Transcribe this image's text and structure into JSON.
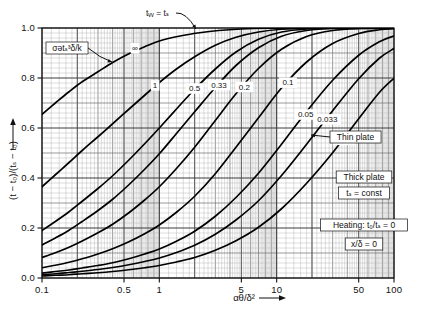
{
  "figure": {
    "panel_label": "(a)",
    "background": "#ffffff",
    "ink": "#111111",
    "grid_major": "#4a4a4a",
    "grid_minor": "#9a9a9a",
    "curve_color": "#000000"
  },
  "chart_data": {
    "type": "line",
    "title": "",
    "subtitle": "",
    "xlabel": "αθ/δ²",
    "ylabel": "(t − t₀)/(tₛ − t₀)",
    "xscale": "log",
    "yscale": "linear",
    "xlim": [
      0.1,
      100
    ],
    "ylim": [
      0.0,
      1.0
    ],
    "grid": "log-minor both axes, dense",
    "legend": "inline curve labels",
    "xticks": [
      "0.1",
      "0.5",
      "1",
      "5",
      "10",
      "50",
      "100"
    ],
    "xtick_values": [
      0.1,
      0.5,
      1,
      5,
      10,
      50,
      100
    ],
    "yticks": [
      "0.0",
      "0.2",
      "0.4",
      "0.6",
      "0.8",
      "1.0"
    ],
    "ytick_values": [
      0.0,
      0.2,
      0.4,
      0.6,
      0.8,
      1.0
    ],
    "series_parameter": "σətₛ³δ/k",
    "series": [
      {
        "name": "∞",
        "label": "∞",
        "points": [
          [
            0.1,
            0.655
          ],
          [
            0.13,
            0.7
          ],
          [
            0.17,
            0.745
          ],
          [
            0.22,
            0.785
          ],
          [
            0.3,
            0.825
          ],
          [
            0.4,
            0.862
          ],
          [
            0.55,
            0.897
          ],
          [
            0.75,
            0.925
          ],
          [
            1.0,
            0.948
          ],
          [
            1.5,
            0.968
          ],
          [
            2.2,
            0.981
          ],
          [
            3.2,
            0.99
          ],
          [
            5,
            0.996
          ],
          [
            8,
            0.999
          ],
          [
            15,
            1.0
          ],
          [
            100,
            1.0
          ]
        ]
      },
      {
        "name": "1",
        "label": "1",
        "points": [
          [
            0.1,
            0.365
          ],
          [
            0.13,
            0.413
          ],
          [
            0.17,
            0.462
          ],
          [
            0.22,
            0.51
          ],
          [
            0.3,
            0.565
          ],
          [
            0.4,
            0.617
          ],
          [
            0.55,
            0.675
          ],
          [
            0.75,
            0.731
          ],
          [
            1.0,
            0.782
          ],
          [
            1.4,
            0.836
          ],
          [
            2.0,
            0.885
          ],
          [
            3.0,
            0.931
          ],
          [
            4.5,
            0.963
          ],
          [
            7,
            0.984
          ],
          [
            11,
            0.995
          ],
          [
            20,
            0.999
          ],
          [
            100,
            1.0
          ]
        ]
      },
      {
        "name": "0.5",
        "label": "0.5",
        "points": [
          [
            0.1,
            0.19
          ],
          [
            0.13,
            0.226
          ],
          [
            0.17,
            0.265
          ],
          [
            0.22,
            0.307
          ],
          [
            0.3,
            0.358
          ],
          [
            0.4,
            0.409
          ],
          [
            0.55,
            0.472
          ],
          [
            0.75,
            0.537
          ],
          [
            1.0,
            0.6
          ],
          [
            1.4,
            0.676
          ],
          [
            2.0,
            0.755
          ],
          [
            3.0,
            0.836
          ],
          [
            4.5,
            0.904
          ],
          [
            7,
            0.955
          ],
          [
            11,
            0.984
          ],
          [
            18,
            0.996
          ],
          [
            30,
            0.999
          ],
          [
            100,
            1.0
          ]
        ]
      },
      {
        "name": "0.33",
        "label": "0.33",
        "points": [
          [
            0.1,
            0.132
          ],
          [
            0.13,
            0.16
          ],
          [
            0.17,
            0.191
          ],
          [
            0.22,
            0.226
          ],
          [
            0.3,
            0.27
          ],
          [
            0.4,
            0.315
          ],
          [
            0.55,
            0.373
          ],
          [
            0.75,
            0.435
          ],
          [
            1.0,
            0.497
          ],
          [
            1.4,
            0.578
          ],
          [
            2.0,
            0.665
          ],
          [
            3.0,
            0.762
          ],
          [
            4.5,
            0.85
          ],
          [
            7,
            0.921
          ],
          [
            11,
            0.967
          ],
          [
            18,
            0.99
          ],
          [
            30,
            0.998
          ],
          [
            100,
            1.0
          ]
        ]
      },
      {
        "name": "0.2",
        "label": "0.2",
        "points": [
          [
            0.1,
            0.082
          ],
          [
            0.13,
            0.101
          ],
          [
            0.17,
            0.123
          ],
          [
            0.22,
            0.148
          ],
          [
            0.3,
            0.181
          ],
          [
            0.4,
            0.215
          ],
          [
            0.55,
            0.261
          ],
          [
            0.75,
            0.312
          ],
          [
            1.0,
            0.365
          ],
          [
            1.4,
            0.438
          ],
          [
            2.0,
            0.523
          ],
          [
            3.0,
            0.63
          ],
          [
            4.5,
            0.737
          ],
          [
            7,
            0.838
          ],
          [
            11,
            0.915
          ],
          [
            18,
            0.966
          ],
          [
            30,
            0.99
          ],
          [
            50,
            0.998
          ],
          [
            100,
            1.0
          ]
        ]
      },
      {
        "name": "0.1",
        "label": "0.1",
        "points": [
          [
            0.1,
            0.041
          ],
          [
            0.13,
            0.051
          ],
          [
            0.17,
            0.063
          ],
          [
            0.22,
            0.077
          ],
          [
            0.3,
            0.096
          ],
          [
            0.4,
            0.117
          ],
          [
            0.55,
            0.145
          ],
          [
            0.75,
            0.177
          ],
          [
            1.0,
            0.212
          ],
          [
            1.4,
            0.263
          ],
          [
            2.0,
            0.327
          ],
          [
            3.0,
            0.417
          ],
          [
            4.5,
            0.523
          ],
          [
            7,
            0.641
          ],
          [
            11,
            0.76
          ],
          [
            18,
            0.864
          ],
          [
            30,
            0.938
          ],
          [
            50,
            0.978
          ],
          [
            75,
            0.993
          ],
          [
            100,
            0.997
          ]
        ]
      },
      {
        "name": "0.05",
        "label": "0.05",
        "points": [
          [
            0.1,
            0.02
          ],
          [
            0.13,
            0.026
          ],
          [
            0.17,
            0.032
          ],
          [
            0.22,
            0.04
          ],
          [
            0.3,
            0.05
          ],
          [
            0.4,
            0.061
          ],
          [
            0.55,
            0.077
          ],
          [
            0.75,
            0.096
          ],
          [
            1.0,
            0.116
          ],
          [
            1.4,
            0.147
          ],
          [
            2.0,
            0.187
          ],
          [
            3.0,
            0.247
          ],
          [
            4.5,
            0.322
          ],
          [
            7,
            0.419
          ],
          [
            11,
            0.535
          ],
          [
            18,
            0.666
          ],
          [
            30,
            0.791
          ],
          [
            50,
            0.891
          ],
          [
            75,
            0.945
          ],
          [
            100,
            0.968
          ]
        ]
      },
      {
        "name": "0.033",
        "label": "0.033",
        "points": [
          [
            0.1,
            0.014
          ],
          [
            0.13,
            0.017
          ],
          [
            0.17,
            0.022
          ],
          [
            0.22,
            0.027
          ],
          [
            0.3,
            0.034
          ],
          [
            0.4,
            0.042
          ],
          [
            0.55,
            0.053
          ],
          [
            0.75,
            0.066
          ],
          [
            1.0,
            0.08
          ],
          [
            1.4,
            0.102
          ],
          [
            2.0,
            0.131
          ],
          [
            3.0,
            0.175
          ],
          [
            4.5,
            0.232
          ],
          [
            7,
            0.309
          ],
          [
            11,
            0.41
          ],
          [
            18,
            0.535
          ],
          [
            30,
            0.669
          ],
          [
            50,
            0.797
          ],
          [
            75,
            0.879
          ],
          [
            100,
            0.918
          ]
        ]
      },
      {
        "name": "0.02",
        "label": "0.02",
        "points": [
          [
            0.1,
            0.008
          ],
          [
            0.13,
            0.011
          ],
          [
            0.17,
            0.013
          ],
          [
            0.22,
            0.017
          ],
          [
            0.3,
            0.021
          ],
          [
            0.4,
            0.026
          ],
          [
            0.55,
            0.033
          ],
          [
            0.75,
            0.041
          ],
          [
            1.0,
            0.05
          ],
          [
            1.4,
            0.064
          ],
          [
            2.0,
            0.082
          ],
          [
            3.0,
            0.111
          ],
          [
            4.5,
            0.149
          ],
          [
            7,
            0.203
          ],
          [
            11,
            0.277
          ],
          [
            18,
            0.379
          ],
          [
            30,
            0.501
          ],
          [
            50,
            0.637
          ],
          [
            75,
            0.742
          ],
          [
            100,
            0.799
          ]
        ]
      }
    ],
    "annotations": [
      {
        "name": "tw-equals-ts",
        "text": "tᵥᵥ = tₛ",
        "kind": "leader-arrow"
      },
      {
        "name": "radiation-parameter",
        "text": "σətₛ³δ/k",
        "kind": "boxed-leader-arrow"
      },
      {
        "name": "thin-plate",
        "text": "Thin plate",
        "kind": "boxed-leader-arrow"
      },
      {
        "name": "conditions",
        "kind": "boxed-text",
        "lines": [
          "Thick plate",
          "tₛ = const",
          "Heating: t₀/tₛ = 0",
          "x/δ = 0"
        ]
      }
    ]
  },
  "annotation_text": {
    "tw_ts": "tᵥᵥ = tₛ",
    "sigma_param": "σətₛ³δ/k",
    "thin_plate": "Thin plate",
    "thick_plate": "Thick plate",
    "ts_const": "tₛ = const",
    "heating": "Heating: t₀/tₛ = 0",
    "x_delta": "x/δ = 0"
  }
}
